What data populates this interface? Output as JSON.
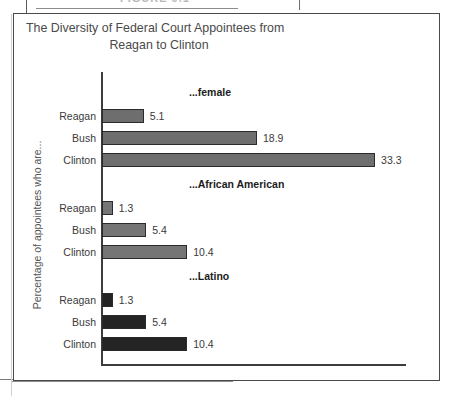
{
  "figure": {
    "caption": "FIGURE 9.1"
  },
  "chart_data": {
    "type": "bar",
    "orientation": "horizontal",
    "title": "The Diversity of Federal Court Appointees from Reagan to Clinton",
    "title_line1": "The Diversity of Federal Court Appointees from",
    "title_line2": "Reagan to Clinton",
    "xlabel": "",
    "ylabel": "Percentage of appointees who are...",
    "xlim": [
      0,
      36
    ],
    "ylim": null,
    "grid": false,
    "legend": "none",
    "categories": [
      "Reagan",
      "Bush",
      "Clinton"
    ],
    "groups": [
      {
        "name": "...female",
        "color": "#6e6e6e",
        "bars": [
          {
            "label": "Reagan",
            "value": 5.1,
            "value_text": "5.1"
          },
          {
            "label": "Bush",
            "value": 18.9,
            "value_text": "18.9"
          },
          {
            "label": "Clinton",
            "value": 33.3,
            "value_text": "33.3"
          }
        ]
      },
      {
        "name": "...African American",
        "color": "#757575",
        "bars": [
          {
            "label": "Reagan",
            "value": 1.3,
            "value_text": "1.3"
          },
          {
            "label": "Bush",
            "value": 5.4,
            "value_text": "5.4"
          },
          {
            "label": "Clinton",
            "value": 10.4,
            "value_text": "10.4"
          }
        ]
      },
      {
        "name": "...Latino",
        "color": "#242424",
        "bars": [
          {
            "label": "Reagan",
            "value": 1.3,
            "value_text": "1.3"
          },
          {
            "label": "Bush",
            "value": 5.4,
            "value_text": "5.4"
          },
          {
            "label": "Clinton",
            "value": 10.4,
            "value_text": "10.4"
          }
        ]
      }
    ],
    "series": [
      {
        "name": "...female",
        "values": [
          5.1,
          18.9,
          33.3
        ]
      },
      {
        "name": "...African American",
        "values": [
          1.3,
          5.4,
          10.4
        ]
      },
      {
        "name": "...Latino",
        "values": [
          1.3,
          5.4,
          10.4
        ]
      }
    ],
    "scale_px_per_unit": 8.2,
    "colors": {
      "axis": "#3d3d3d",
      "frame": "#4a4a4a",
      "text": "#3a3a3a",
      "bar_light": "#6e6e6e",
      "bar_mid": "#757575",
      "bar_dark": "#242424"
    }
  }
}
